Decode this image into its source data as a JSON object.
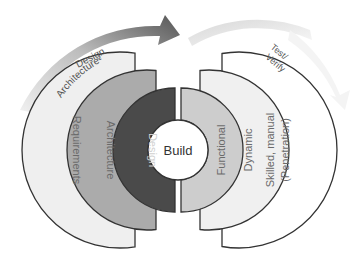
{
  "diagram": {
    "center": {
      "label": "Build"
    },
    "left_phase": {
      "arrow_label_line1": "Architecture-",
      "arrow_label_line2": "Design",
      "rings": [
        {
          "label": "Design",
          "color": "#4a4a4a",
          "text_color": "#d0d0d0"
        },
        {
          "label": "Architecture",
          "color": "#ababab",
          "text_color": "#666666"
        },
        {
          "label": "Requirements",
          "color": "#efefef",
          "text_color": "#666666"
        }
      ]
    },
    "right_phase": {
      "arrow_label_line1": "Test/",
      "arrow_label_line2": "Verify",
      "rings": [
        {
          "label": "Functional",
          "color": "#cdcdcd",
          "text_color": "#666666"
        },
        {
          "label": "Dynamic",
          "color": "#f0f0f0",
          "text_color": "#666666"
        },
        {
          "label": "Skilled, manual",
          "label2": "(Penetration)",
          "color": "#ffffff",
          "text_color": "#666666"
        }
      ]
    }
  }
}
